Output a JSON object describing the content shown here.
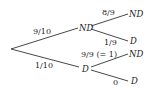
{
  "tree": {
    "root": {
      "x": 11,
      "y": 49
    },
    "level1": [
      {
        "node_label": "ND",
        "edge_label": "9/10",
        "edge_to": {
          "x": 78,
          "y": 28
        },
        "label_pos": {
          "x": 33,
          "y": 34
        },
        "node_pos": {
          "x": 79,
          "y": 31
        }
      },
      {
        "node_label": "D",
        "edge_label": "1/10",
        "edge_to": {
          "x": 79,
          "y": 67
        },
        "label_pos": {
          "x": 35,
          "y": 68
        },
        "node_pos": {
          "x": 82,
          "y": 72
        }
      }
    ],
    "level2": [
      {
        "parent": 0,
        "node_label": "ND",
        "edge_label": "8/9",
        "from": {
          "x": 91,
          "y": 26
        },
        "to": {
          "x": 128,
          "y": 14
        },
        "label_pos": {
          "x": 102,
          "y": 15
        },
        "node_pos": {
          "x": 129,
          "y": 17
        }
      },
      {
        "parent": 0,
        "node_label": "D",
        "edge_label": "1/9",
        "from": {
          "x": 91,
          "y": 29
        },
        "to": {
          "x": 128,
          "y": 41
        },
        "label_pos": {
          "x": 104,
          "y": 45
        },
        "node_pos": {
          "x": 130,
          "y": 44
        }
      },
      {
        "parent": 1,
        "node_label": "ND",
        "edge_label": "9/9 (= 1)",
        "from": {
          "x": 91,
          "y": 67
        },
        "to": {
          "x": 128,
          "y": 54
        },
        "label_pos": {
          "x": 81,
          "y": 57
        },
        "node_pos": {
          "x": 129,
          "y": 57
        }
      },
      {
        "parent": 1,
        "node_label": "D",
        "edge_label": "0",
        "from": {
          "x": 91,
          "y": 70
        },
        "to": {
          "x": 128,
          "y": 81
        },
        "label_pos": {
          "x": 113,
          "y": 85
        },
        "node_pos": {
          "x": 131,
          "y": 84
        }
      }
    ]
  },
  "labels": {
    "p_nd": "9/10",
    "p_d": "1/10",
    "nd_nd": "8/9",
    "nd_d": "1/9",
    "d_nd": "9/9 (= 1)",
    "d_d": "0",
    "node_nd": "ND",
    "node_d": "D"
  }
}
